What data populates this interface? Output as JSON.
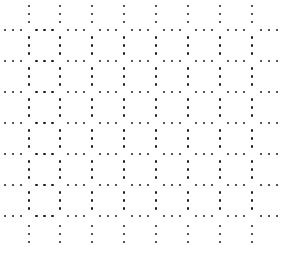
{
  "pattern": {
    "type": "dotted-grid",
    "dot_color": "#1e1e1e",
    "dot_size": 2.5,
    "columns_x": [
      29,
      60,
      92,
      124,
      156,
      188,
      220,
      252
    ],
    "rows_y": [
      30,
      61,
      92,
      123,
      154,
      185,
      216
    ],
    "dot_step": 8,
    "dots_per_segment": 3,
    "segment_offset": 8,
    "first_row_top_dots_y": [
      6,
      14,
      22
    ],
    "last_row_bottom_dots_y": [
      226,
      234,
      242
    ],
    "first_col_left_dots_x": [
      5,
      13,
      21
    ],
    "last_col_right_dots_x": [
      261,
      269,
      277
    ]
  }
}
